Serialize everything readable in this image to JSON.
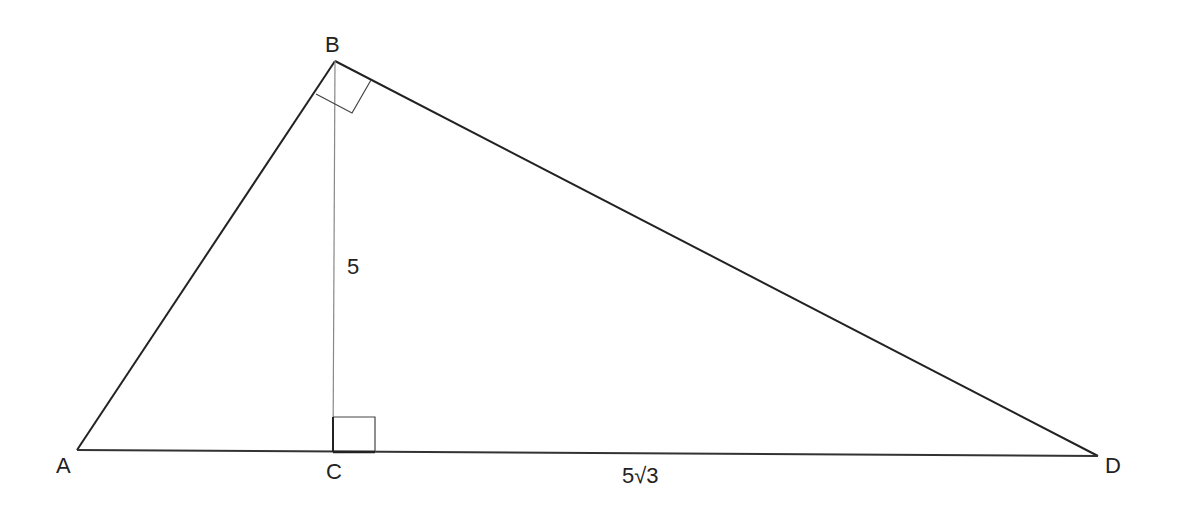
{
  "diagram": {
    "type": "right-triangle-with-altitude",
    "vertices": {
      "A": {
        "label": "A",
        "x": 77,
        "y": 450
      },
      "B": {
        "label": "B",
        "x": 335,
        "y": 61
      },
      "C": {
        "label": "C",
        "x": 333,
        "y": 452
      },
      "D": {
        "label": "D",
        "x": 1098,
        "y": 456
      }
    },
    "segments": [
      {
        "from": "A",
        "to": "B"
      },
      {
        "from": "B",
        "to": "D"
      },
      {
        "from": "A",
        "to": "D"
      },
      {
        "from": "B",
        "to": "C",
        "style": "thin"
      }
    ],
    "measurements": {
      "BC": "5",
      "CD": "5√3"
    },
    "right_angles": [
      "ABD",
      "BCD"
    ],
    "colors": {
      "line": "#222222",
      "thin_line": "#888888",
      "background": "#ffffff"
    }
  }
}
